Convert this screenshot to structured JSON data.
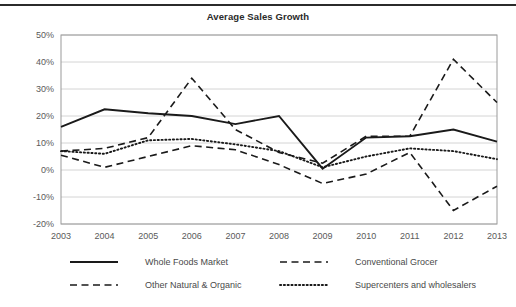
{
  "chart_data": {
    "type": "line",
    "title": "Average Sales Growth",
    "xlabel": "",
    "ylabel": "",
    "x": [
      "2003",
      "2004",
      "2005",
      "2006",
      "2007",
      "2008",
      "2009",
      "2010",
      "2011",
      "2012",
      "2013"
    ],
    "categories": [
      "2003",
      "2004",
      "2005",
      "2006",
      "2007",
      "2008",
      "2009",
      "2010",
      "2011",
      "2012",
      "2013"
    ],
    "ylim": [
      -20,
      50
    ],
    "ytick_labels": [
      "50%",
      "40%",
      "30%",
      "20%",
      "10%",
      "0%",
      "-10%",
      "-20%"
    ],
    "ytick_values": [
      50,
      40,
      30,
      20,
      10,
      0,
      -10,
      -20
    ],
    "grid": true,
    "legend_position": "bottom",
    "series": [
      {
        "name": "Whole Foods Market",
        "style": "solid",
        "color": "#1a1a1a",
        "values": [
          16,
          22.5,
          21,
          20,
          17,
          20,
          0.5,
          12,
          12.5,
          15,
          10.5
        ]
      },
      {
        "name": "Conventional Grocer",
        "style": "dashed",
        "color": "#1a1a1a",
        "values": [
          5.5,
          1,
          5,
          9,
          7.5,
          2,
          -5,
          -1.5,
          6.5,
          -15,
          -6
        ]
      },
      {
        "name": "Other Natural & Organic",
        "style": "dashed",
        "color": "#1a1a1a",
        "values": [
          7,
          8,
          12,
          34,
          15,
          6.5,
          2.5,
          12.5,
          12.5,
          41,
          25
        ]
      },
      {
        "name": "Supercenters and wholesalers",
        "style": "dotted",
        "color": "#1a1a1a",
        "values": [
          7,
          6,
          11,
          11.5,
          9.5,
          7,
          1,
          5,
          8,
          7,
          4
        ]
      }
    ]
  },
  "legend": {
    "entries": [
      {
        "label": "Whole Foods Market",
        "style": "solid"
      },
      {
        "label": "Conventional Grocer",
        "style": "dashed"
      },
      {
        "label": "Other Natural & Organic",
        "style": "dashed"
      },
      {
        "label": "Supercenters and wholesalers",
        "style": "dotted"
      }
    ]
  },
  "page": {
    "top_caption_partial": ""
  }
}
